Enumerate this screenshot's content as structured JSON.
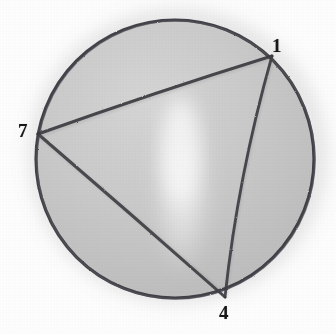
{
  "figure": {
    "medium": "pencil sketch on paper",
    "background_color": "#fefefe",
    "disc_fill_color": "#c9c9c9",
    "stroke_color": "#33333a",
    "label_color": "#17171a",
    "circle": {
      "center_x": 175,
      "center_y": 159,
      "radius": 139,
      "stroke_width": 3.2
    },
    "vertices": [
      {
        "label": "1",
        "cx": 272,
        "cy": 56,
        "label_x": 272,
        "label_y": 36
      },
      {
        "label": "7",
        "cx": 38,
        "cy": 134,
        "label_x": 18,
        "label_y": 121
      },
      {
        "label": "4",
        "cx": 225,
        "cy": 297,
        "label_x": 219,
        "label_y": 303
      }
    ],
    "chords": [
      {
        "name": "chord-7-1",
        "from": "7",
        "to": "1"
      },
      {
        "name": "chord-1-4",
        "from": "1",
        "to": "4"
      },
      {
        "name": "chord-7-4",
        "from": "7",
        "to": "4"
      }
    ],
    "highlight": {
      "name": "glare-band",
      "center_x": 182,
      "center_y": 178,
      "width": 62,
      "height": 196
    }
  }
}
